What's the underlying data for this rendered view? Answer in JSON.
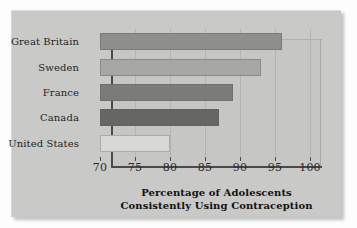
{
  "chart_data": {
    "type": "bar",
    "orientation": "horizontal",
    "title": "",
    "xlabel": "Percentage of Adolescents Consistently Using Contraception",
    "xlabel_line1": "Percentage of Adolescents",
    "xlabel_line2": "Consistently Using Contraception",
    "ylabel": "",
    "categories": [
      "Great Britain",
      "Sweden",
      "France",
      "Canada",
      "United States"
    ],
    "values": [
      96,
      93,
      89,
      87,
      80
    ],
    "xlim": [
      70,
      100
    ],
    "xticks": [
      70,
      75,
      80,
      85,
      90,
      95,
      100
    ],
    "xtick_labels": [
      "70",
      "75",
      "80",
      "85",
      "90",
      "95",
      "100"
    ],
    "grid": true,
    "legend": false,
    "bar_colors": [
      "#8e8e8c",
      "#a6a6a4",
      "#7b7b79",
      "#666664",
      "#d8d8d6"
    ],
    "background_color": "#c9c9c7",
    "plot_background_color": "#c6c6c4",
    "axis_color": "#4a4a4a"
  }
}
